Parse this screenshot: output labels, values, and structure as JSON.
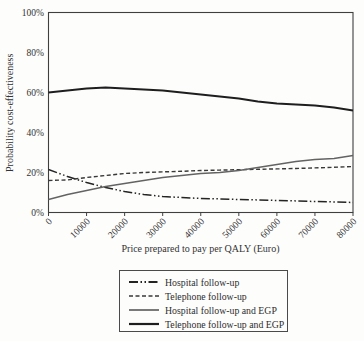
{
  "chart_data": {
    "type": "line",
    "title": "",
    "xlabel": "Price prepared to pay per QALY (Euro)",
    "ylabel": "Probability cost-effectiveness",
    "xlim": [
      0,
      80000
    ],
    "ylim": [
      0,
      100
    ],
    "grid": false,
    "legend_position": "bottom-outside-boxed",
    "x_ticks": [
      0,
      10000,
      20000,
      30000,
      40000,
      50000,
      60000,
      70000,
      80000
    ],
    "y_ticks": [
      "0%",
      "20%",
      "40%",
      "60%",
      "80%",
      "100%"
    ],
    "y_tick_values": [
      0,
      20,
      40,
      60,
      80,
      100
    ],
    "x": [
      0,
      5000,
      10000,
      15000,
      20000,
      25000,
      30000,
      35000,
      40000,
      45000,
      50000,
      55000,
      60000,
      65000,
      70000,
      75000,
      80000
    ],
    "series": [
      {
        "name": "Hospital follow-up",
        "line_style": "dash-dot-dot",
        "color": "#242424",
        "width": 1.5,
        "values": [
          21.5,
          18,
          15,
          12.5,
          10.5,
          9,
          8,
          7.5,
          7,
          6.8,
          6.5,
          6.3,
          6,
          5.8,
          5.5,
          5.3,
          5
        ]
      },
      {
        "name": "Telephone follow-up",
        "line_style": "dashed",
        "color": "#383838",
        "width": 1.4,
        "values": [
          16,
          16.3,
          17.5,
          18.5,
          19.5,
          20,
          20.3,
          20.6,
          21,
          21.2,
          21.4,
          21.6,
          21.8,
          22,
          22.3,
          22.6,
          23
        ]
      },
      {
        "name": "Hospital follow-up and EGP",
        "line_style": "solid",
        "color": "#636363",
        "width": 1.4,
        "values": [
          6.5,
          9,
          11,
          13,
          14.5,
          16,
          17.5,
          18.5,
          19.5,
          20,
          21,
          22.5,
          24,
          25.5,
          26.5,
          27,
          28.5
        ]
      },
      {
        "name": "Telephone follow-up and EGP",
        "line_style": "solid",
        "color": "#1e1e1e",
        "width": 1.9,
        "values": [
          60,
          61,
          62,
          62.5,
          62,
          61.5,
          61,
          60,
          59,
          58,
          57,
          55.5,
          54.5,
          54,
          53.5,
          52.5,
          51
        ]
      }
    ]
  }
}
